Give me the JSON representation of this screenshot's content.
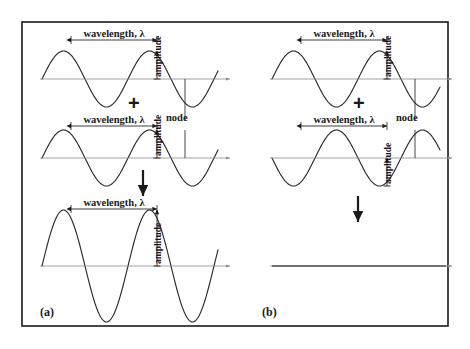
{
  "figure": {
    "title_text": "",
    "background_color": "#ffffff",
    "frame_color": "#1a1a1a",
    "curve_color": "#2b2b2b",
    "axis_color": "#8c8c8c",
    "text_color": "#1a1a1a",
    "frame": {
      "x": 22,
      "y": 22,
      "width": 426,
      "height": 304
    }
  },
  "labels": {
    "wavelength": "wavelength, λ",
    "amplitude": "amplitude",
    "node": "node",
    "plus": "+",
    "panel_a": "(a)",
    "panel_b": "(b)"
  },
  "panels": [
    {
      "id": "a",
      "label": "(a)",
      "interference": "constructive",
      "waves": [
        {
          "name": "wave-a-1",
          "role": "input",
          "baseline_y": 79,
          "amplitude": 28,
          "wavelength": 86,
          "phase_deg": 0,
          "x_start": 42,
          "x_end": 218,
          "has_wavelength_label": true,
          "has_amplitude_label": true,
          "has_node_marker": true
        },
        {
          "name": "wave-a-2",
          "role": "input",
          "baseline_y": 158,
          "amplitude": 28,
          "wavelength": 86,
          "phase_deg": 0,
          "x_start": 42,
          "x_end": 218,
          "has_wavelength_label": true,
          "has_amplitude_label": true,
          "has_node_marker": true
        },
        {
          "name": "wave-a-result",
          "role": "result",
          "baseline_y": 266,
          "amplitude": 56,
          "wavelength": 86,
          "phase_deg": 0,
          "x_start": 42,
          "x_end": 218,
          "has_wavelength_label": true,
          "has_amplitude_label": true,
          "has_node_marker": false
        }
      ],
      "operators": [
        {
          "name": "plus-operator-a",
          "symbol": "+",
          "x": 128,
          "y": 104
        },
        {
          "name": "result-arrow-a",
          "symbol": "arrow-down",
          "x": 143,
          "y": 170,
          "length": 26
        }
      ]
    },
    {
      "id": "b",
      "label": "(b)",
      "interference": "destructive",
      "waves": [
        {
          "name": "wave-b-1",
          "role": "input",
          "baseline_y": 79,
          "amplitude": 28,
          "wavelength": 86,
          "phase_deg": 0,
          "x_start": 272,
          "x_end": 440,
          "has_wavelength_label": true,
          "has_amplitude_label": true,
          "has_node_marker": true
        },
        {
          "name": "wave-b-2",
          "role": "input",
          "baseline_y": 158,
          "amplitude": 28,
          "wavelength": 86,
          "phase_deg": 180,
          "x_start": 272,
          "x_end": 440,
          "has_wavelength_label": true,
          "has_amplitude_label": true,
          "has_node_marker": true
        },
        {
          "name": "wave-b-result",
          "role": "result",
          "baseline_y": 266,
          "amplitude": 0,
          "wavelength": 86,
          "phase_deg": 0,
          "x_start": 272,
          "x_end": 440,
          "has_wavelength_label": false,
          "has_amplitude_label": false,
          "has_node_marker": false
        }
      ],
      "operators": [
        {
          "name": "plus-operator-b",
          "symbol": "+",
          "x": 353,
          "y": 104
        },
        {
          "name": "result-arrow-b",
          "symbol": "arrow-down",
          "x": 358,
          "y": 196,
          "length": 26
        }
      ]
    }
  ],
  "annotations": {
    "wavelength_spans": [
      {
        "name": "wavelength-span-a1",
        "x1": 71,
        "x2": 157,
        "y": 40
      },
      {
        "name": "wavelength-span-a2",
        "x1": 71,
        "x2": 157,
        "y": 126
      },
      {
        "name": "wavelength-span-a3",
        "x1": 71,
        "x2": 157,
        "y": 209
      },
      {
        "name": "wavelength-span-b1",
        "x1": 301,
        "x2": 387,
        "y": 40
      },
      {
        "name": "wavelength-span-b2",
        "x1": 301,
        "x2": 387,
        "y": 126
      }
    ],
    "amplitude_spans": [
      {
        "name": "amplitude-span-a1",
        "x": 157,
        "y1": 51,
        "y2": 79
      },
      {
        "name": "amplitude-span-a2",
        "x": 157,
        "y1": 130,
        "y2": 158
      },
      {
        "name": "amplitude-span-a3",
        "x": 157,
        "y1": 210,
        "y2": 266
      },
      {
        "name": "amplitude-span-b1",
        "x": 387,
        "y1": 51,
        "y2": 79
      },
      {
        "name": "amplitude-span-b2",
        "x": 387,
        "y1": 158,
        "y2": 186
      }
    ],
    "node_lines": [
      {
        "name": "node-line-a",
        "x": 185,
        "y1": 79,
        "y2": 120
      },
      {
        "name": "node-line-a2",
        "x": 185,
        "y1": 130,
        "y2": 158
      },
      {
        "name": "node-line-b",
        "x": 415,
        "y1": 79,
        "y2": 120
      },
      {
        "name": "node-line-b2",
        "x": 415,
        "y1": 130,
        "y2": 158
      }
    ],
    "node_label_positions": [
      {
        "name": "node-label-a",
        "x": 166,
        "y": 113
      },
      {
        "name": "node-label-b",
        "x": 396,
        "y": 113
      }
    ]
  }
}
